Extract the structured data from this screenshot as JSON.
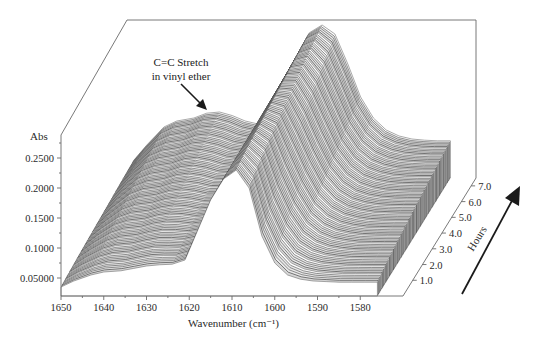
{
  "chart_data": {
    "type": "surface3d",
    "title": "",
    "annotation": {
      "lines": [
        "C=C Stretch",
        "in vinyl ether"
      ],
      "points_to_wavenumber": 1632
    },
    "x_axis": {
      "label": "Wavenumber (cm⁻¹)",
      "ticks": [
        "1650",
        "1640",
        "1630",
        "1620",
        "1610",
        "1600",
        "1590",
        "1580"
      ],
      "range": [
        1650,
        1575
      ],
      "reversed": true
    },
    "y_axis": {
      "label": "Abs",
      "ticks": [
        "0.05000",
        "0.1000",
        "0.1500",
        "0.2000",
        "0.2500"
      ],
      "range": [
        0.02,
        0.29
      ]
    },
    "z_axis": {
      "label": "Hours",
      "ticks": [
        "1.0",
        "2.0",
        "3.0",
        "4.0",
        "5.0",
        "6.0",
        "7.0"
      ],
      "range": [
        0,
        7.5
      ]
    },
    "wavenumbers": [
      1650,
      1647,
      1643,
      1640,
      1636,
      1633,
      1630,
      1627,
      1624,
      1621,
      1618,
      1615,
      1612,
      1609,
      1606,
      1603,
      1600,
      1597,
      1594,
      1591,
      1588,
      1585,
      1582,
      1579,
      1576
    ],
    "series": [
      {
        "name": "t=0 h",
        "values": [
          0.035,
          0.045,
          0.055,
          0.06,
          0.062,
          0.066,
          0.07,
          0.072,
          0.073,
          0.08,
          0.13,
          0.18,
          0.215,
          0.23,
          0.2,
          0.12,
          0.075,
          0.055,
          0.048,
          0.045,
          0.044,
          0.043,
          0.043,
          0.043,
          0.043
        ]
      },
      {
        "name": "t=7.5 h",
        "values": [
          0.05,
          0.075,
          0.105,
          0.115,
          0.12,
          0.128,
          0.13,
          0.124,
          0.115,
          0.11,
          0.112,
          0.16,
          0.22,
          0.262,
          0.275,
          0.26,
          0.21,
          0.155,
          0.12,
          0.1,
          0.09,
          0.085,
          0.083,
          0.082,
          0.082
        ]
      }
    ],
    "time_arrow": "direction of increasing time (hours)"
  }
}
